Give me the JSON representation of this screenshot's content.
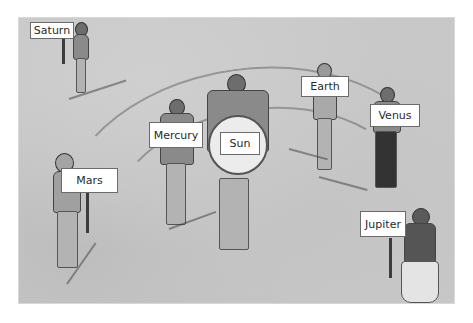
{
  "scene": {
    "description": "Illustration of children modeling the solar system, each holding a planet label sign",
    "background_color": "#c8c8c8"
  },
  "labels": {
    "saturn": "Saturn",
    "mercury": "Mercury",
    "sun": "Sun",
    "earth": "Earth",
    "venus": "Venus",
    "mars": "Mars",
    "jupiter": "Jupiter"
  }
}
